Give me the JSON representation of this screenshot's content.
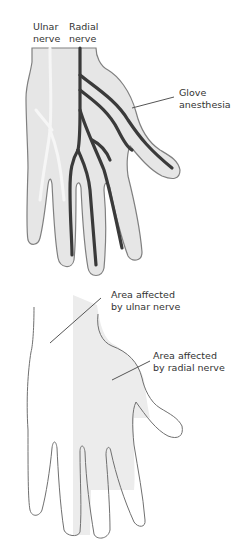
{
  "figure": {
    "top_panel": {
      "name": "Glove anesthesia hand",
      "labels": {
        "ulnar": [
          "Ulnar",
          "nerve"
        ],
        "radial": [
          "Radial",
          "nerve"
        ],
        "glove": [
          "Glove",
          "anesthesia"
        ]
      }
    },
    "bottom_panel": {
      "name": "Nerve distribution hand",
      "labels": {
        "ulnar_area": [
          "Area affected",
          "by ulnar nerve"
        ],
        "radial_area": [
          "Area affected",
          "by radial nerve"
        ]
      }
    },
    "colors": {
      "hand_fill": "#e6e6e6",
      "hand_outline": "#808080",
      "nerve": "#3a3a3a",
      "ulnar_nerve_faint": "#f4f4f4",
      "radial_area_fill": "#ececec",
      "label_text": "#333333",
      "leader_line": "#555555"
    }
  }
}
